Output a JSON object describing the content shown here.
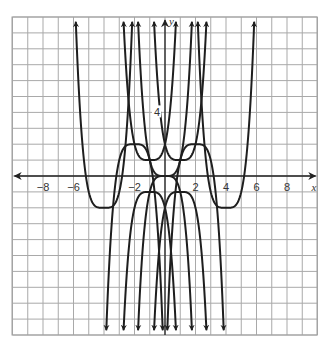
{
  "chart_data": {
    "type": "line",
    "title": "",
    "xlabel": "x",
    "ylabel": "y",
    "xlim": [
      -10,
      10
    ],
    "ylim": [
      -10,
      10
    ],
    "grid": true,
    "grid_step": 1,
    "x_tick_labels": [
      {
        "value": -8,
        "text": "−8"
      },
      {
        "value": -6,
        "text": "−6"
      },
      {
        "value": -2,
        "text": "−2"
      },
      {
        "value": 2,
        "text": "2"
      },
      {
        "value": 4,
        "text": "4"
      },
      {
        "value": 6,
        "text": "6"
      },
      {
        "value": 8,
        "text": "8"
      }
    ],
    "y_tick_labels": [
      {
        "value": 4,
        "text": "4"
      }
    ],
    "legend": null,
    "series": [
      {
        "name": "y = x^4",
        "h": 0,
        "k": 0,
        "a": 1
      },
      {
        "name": "y = (x+1)^4 + 1",
        "h": -1,
        "k": 1,
        "a": 1
      },
      {
        "name": "y = (x-1)^4 + 1",
        "h": 1,
        "k": 1,
        "a": 1
      },
      {
        "name": "y = (x+4)^4 - 2",
        "h": -4,
        "k": -2,
        "a": 1
      },
      {
        "name": "y = (x-4)^4 - 2",
        "h": 4,
        "k": -2,
        "a": 1
      },
      {
        "name": "y = -x^4",
        "h": 0,
        "k": 0,
        "a": -1
      },
      {
        "name": "y = -(x+1)^4 - 1",
        "h": -1,
        "k": -1,
        "a": -1
      },
      {
        "name": "y = -(x-1)^4 - 1",
        "h": 1,
        "k": -1,
        "a": -1
      },
      {
        "name": "y = -(x+2)^4 + 2",
        "h": -2,
        "k": 2,
        "a": -1
      },
      {
        "name": "y = -(x-2)^4 + 2",
        "h": 2,
        "k": 2,
        "a": -1
      }
    ],
    "vertices": [
      [
        0,
        0
      ],
      [
        -1,
        1
      ],
      [
        1,
        1
      ],
      [
        -4,
        -2
      ],
      [
        4,
        -2
      ],
      [
        0,
        0
      ],
      [
        -1,
        -1
      ],
      [
        1,
        -1
      ],
      [
        -2,
        2
      ],
      [
        2,
        2
      ]
    ]
  },
  "colors": {
    "grid": "#a9a9a9",
    "axis": "#222222",
    "curve": "#1e1e1e",
    "background": "#ffffff"
  }
}
